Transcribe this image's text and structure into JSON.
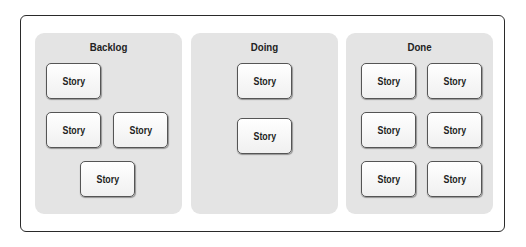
{
  "board": {
    "columns": [
      {
        "title": "Backlog",
        "cards": [
          "Story",
          "Story",
          "Story",
          "Story"
        ]
      },
      {
        "title": "Doing",
        "cards": [
          "Story",
          "Story"
        ]
      },
      {
        "title": "Done",
        "cards": [
          "Story",
          "Story",
          "Story",
          "Story",
          "Story",
          "Story"
        ]
      }
    ]
  },
  "colors": {
    "column_bg": "#e4e4e4",
    "card_border": "#555555",
    "frame_border": "#2a2a2a"
  }
}
